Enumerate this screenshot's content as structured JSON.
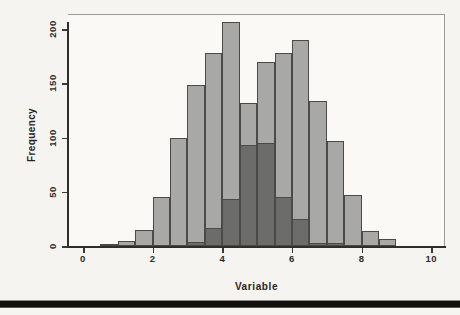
{
  "figure": {
    "background": "#f6f4f0",
    "plot_background": "#faf9f6",
    "bottom_rule_color": "#101010"
  },
  "chart_data": {
    "type": "bar",
    "subtype": "overlaid-histograms",
    "title": "",
    "xlabel": "Variable",
    "ylabel": "Frequency",
    "xlim": [
      0,
      10
    ],
    "ylim": [
      0,
      200
    ],
    "x_ticks": [
      0,
      2,
      4,
      6,
      8,
      10
    ],
    "y_ticks": [
      0,
      50,
      100,
      150,
      200
    ],
    "bin_width": 0.5,
    "grid": "off",
    "legend": "none",
    "series": [
      {
        "name": "histogram-1",
        "bin_start": 0.5,
        "values": [
          2,
          5,
          15,
          45,
          100,
          148,
          178,
          206,
          132,
          95,
          45,
          25,
          3,
          3
        ]
      },
      {
        "name": "histogram-2",
        "bin_start": 3.0,
        "values": [
          4,
          17,
          43,
          93,
          170,
          178,
          190,
          134,
          97,
          47,
          14,
          6
        ]
      }
    ],
    "colors": {
      "single": "#a8a8a6",
      "overlap": "#6c6c6a",
      "bar_border": "#4a4a47",
      "axis": "#2e2e2c"
    }
  }
}
